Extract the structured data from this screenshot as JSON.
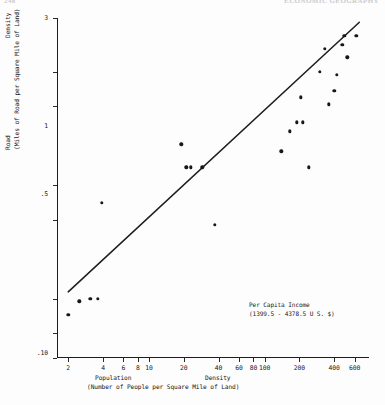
{
  "page": {
    "header_left": "248",
    "header_right": "ECONOMIC GEOGRAPHY"
  },
  "annotation": {
    "line1": "Per Capita Income",
    "line2": "(1399.5 - 4378.5 U S. $)"
  },
  "axis_titles": {
    "x_word1": "Population",
    "x_word2": "Density",
    "x_sub": "(Number of People per Square Mile of Land)",
    "y_word1": "Road",
    "y_word2": "Density",
    "y_sub": "(Miles of Road per Square Mile of Land)"
  },
  "chart_data": {
    "type": "scatter",
    "title": "",
    "xlabel": "Population Density (Number of People per Square Mile of Land)",
    "ylabel": "Road Density (Miles of Road per Square Mile of Land)",
    "xscale": "log",
    "yscale": "log",
    "xlim": [
      1.6,
      800
    ],
    "ylim": [
      0.003,
      3
    ],
    "grid": false,
    "legend": null,
    "xticks": [
      2,
      4,
      6,
      8,
      10,
      20,
      40,
      60,
      80,
      100,
      200,
      400,
      600
    ],
    "xticklabels": [
      "2",
      "4",
      "6",
      "8",
      "10",
      "20",
      "40",
      "60",
      "80",
      "100",
      "200",
      "400",
      "600"
    ],
    "yticks": [
      0.003,
      0.005,
      0.01,
      0.05,
      0.1,
      0.5,
      1,
      3
    ],
    "yticklabels": [
      ".003",
      ".005",
      ".010",
      ".05",
      ".10",
      ".5",
      "1",
      "3"
    ],
    "points": [
      {
        "x": 2.0,
        "y": 0.0072
      },
      {
        "x": 2.5,
        "y": 0.0095
      },
      {
        "x": 3.1,
        "y": 0.01
      },
      {
        "x": 3.6,
        "y": 0.01
      },
      {
        "x": 3.9,
        "y": 0.07
      },
      {
        "x": 19.0,
        "y": 0.23
      },
      {
        "x": 21.0,
        "y": 0.145
      },
      {
        "x": 23.0,
        "y": 0.145
      },
      {
        "x": 29.0,
        "y": 0.145
      },
      {
        "x": 37.0,
        "y": 0.045
      },
      {
        "x": 140.0,
        "y": 0.2
      },
      {
        "x": 165.0,
        "y": 0.3
      },
      {
        "x": 190.0,
        "y": 0.36
      },
      {
        "x": 205.0,
        "y": 0.6
      },
      {
        "x": 215.0,
        "y": 0.36
      },
      {
        "x": 240.0,
        "y": 0.145
      },
      {
        "x": 300.0,
        "y": 1.0
      },
      {
        "x": 330.0,
        "y": 1.6
      },
      {
        "x": 360.0,
        "y": 0.52
      },
      {
        "x": 400.0,
        "y": 0.68
      },
      {
        "x": 420.0,
        "y": 0.95
      },
      {
        "x": 470.0,
        "y": 1.75
      },
      {
        "x": 490.0,
        "y": 2.1
      },
      {
        "x": 520.0,
        "y": 1.35
      },
      {
        "x": 620.0,
        "y": 2.1
      }
    ],
    "fit_line": {
      "label": "regression line",
      "x_start": 2.0,
      "y_start": 0.0115,
      "x_end": 660.0,
      "y_end": 2.75
    }
  }
}
